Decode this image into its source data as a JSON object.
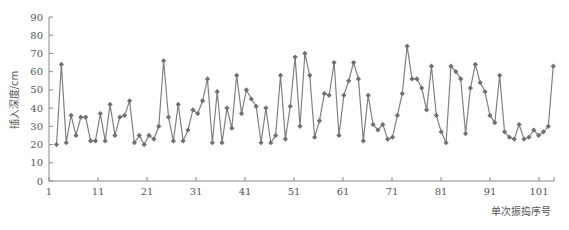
{
  "chart_data": {
    "type": "line",
    "title": "",
    "xlabel": "单次振捣序号",
    "ylabel": "插入深度/cm",
    "xlim": [
      1,
      104
    ],
    "ylim": [
      0,
      90
    ],
    "x_ticks": [
      1,
      11,
      21,
      31,
      41,
      51,
      61,
      71,
      81,
      91,
      101
    ],
    "y_ticks": [
      0,
      10,
      20,
      30,
      40,
      50,
      60,
      70,
      80,
      90
    ],
    "grid": false,
    "legend": null,
    "series": [
      {
        "name": "插入深度",
        "color": "#808080",
        "marker": "diamond",
        "x": [
          1,
          2,
          3,
          4,
          5,
          6,
          7,
          8,
          9,
          10,
          11,
          12,
          13,
          14,
          15,
          16,
          17,
          18,
          19,
          20,
          21,
          22,
          23,
          24,
          25,
          26,
          27,
          28,
          29,
          30,
          31,
          32,
          33,
          34,
          35,
          36,
          37,
          38,
          39,
          40,
          41,
          42,
          43,
          44,
          45,
          46,
          47,
          48,
          49,
          50,
          51,
          52,
          53,
          54,
          55,
          56,
          57,
          58,
          59,
          60,
          61,
          62,
          63,
          64,
          65,
          66,
          67,
          68,
          69,
          70,
          71,
          72,
          73,
          74,
          75,
          76,
          77,
          78,
          79,
          80,
          81,
          82,
          83,
          84,
          85,
          86,
          87,
          88,
          89,
          90,
          91,
          92,
          93,
          94,
          95,
          96,
          97,
          98,
          99,
          100,
          101,
          102,
          103
        ],
        "values": [
          20,
          64,
          21,
          36,
          25,
          35,
          35,
          22,
          22,
          37,
          22,
          42,
          25,
          35,
          36,
          44,
          21,
          25,
          20,
          25,
          23,
          30,
          66,
          35,
          22,
          42,
          22,
          28,
          39,
          37,
          44,
          56,
          21,
          49,
          21,
          40,
          29,
          58,
          37,
          50,
          45,
          41,
          21,
          40,
          21,
          25,
          58,
          23,
          41,
          68,
          30,
          70,
          58,
          24,
          33,
          48,
          47,
          65,
          25,
          47,
          55,
          65,
          56,
          22,
          47,
          31,
          28,
          31,
          23,
          24,
          36,
          48,
          74,
          56,
          56,
          51,
          39,
          63,
          36,
          27,
          21,
          63,
          60,
          56,
          26,
          51,
          64,
          54,
          49,
          36,
          32,
          58,
          27,
          24,
          23,
          31,
          23,
          24,
          28,
          25,
          27,
          30,
          63
        ]
      }
    ]
  }
}
